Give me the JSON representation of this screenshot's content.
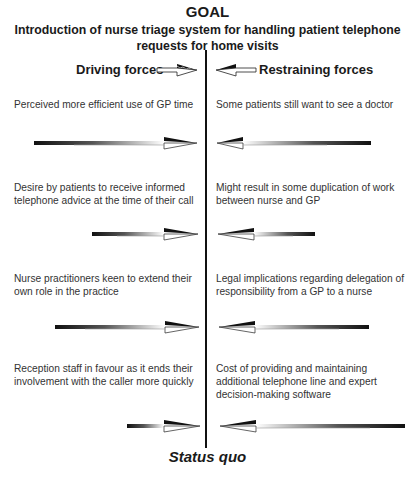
{
  "goal": {
    "label": "GOAL",
    "description": "Introduction of nurse triage system for handling patient telephone requests for home visits"
  },
  "headers": {
    "driving": "Driving forces",
    "restraining": "Restraining forces"
  },
  "driving_forces": [
    {
      "text": "Perceived more efficient use of GP time",
      "arrow_length": 162
    },
    {
      "text": "Desire by patients to receive informed telephone advice at the time of their call",
      "arrow_length": 105
    },
    {
      "text": "Nurse practitioners keen to extend their own role in the practice",
      "arrow_length": 143
    },
    {
      "text": "Reception staff in favour as it ends their involvement with the caller more quickly",
      "arrow_length": 72
    }
  ],
  "restraining_forces": [
    {
      "text": "Some patients still want to see a doctor",
      "arrow_length": 153
    },
    {
      "text": "Might result in some duplication of work between nurse and GP",
      "arrow_length": 96
    },
    {
      "text": "Legal implications regarding delegation of responsibility from a GP to a nurse",
      "arrow_length": 149
    },
    {
      "text": "Cost of providing and maintaining additional telephone line and expert decision-making software",
      "arrow_length": 184
    }
  ],
  "footer": {
    "label": "Status quo"
  },
  "colors": {
    "line": "#111111",
    "text": "#333333"
  }
}
